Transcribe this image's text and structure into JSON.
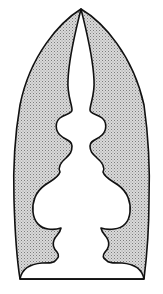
{
  "figure": {
    "colors": {
      "background": "#ffffff",
      "stroke": "#111111",
      "stipple_fill": "#cfcfcf",
      "stipple_dot": "#8a8a8a",
      "cutout_fill": "#ffffff"
    }
  }
}
